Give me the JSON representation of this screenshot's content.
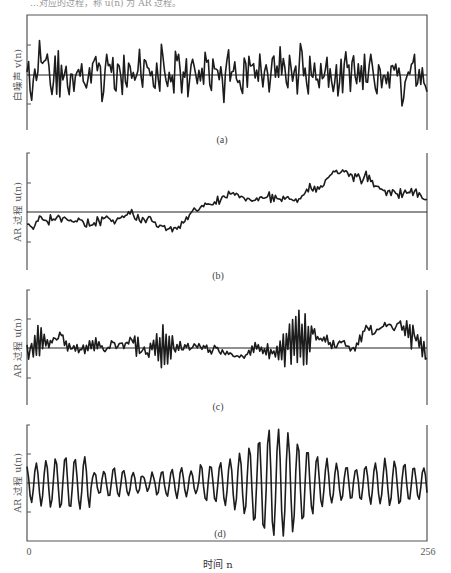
{
  "header_fragment": "…对应的过程，称 u(n) 为 AR 过程。",
  "chart_data": [
    {
      "id": "a",
      "type": "line",
      "caption": "(a)",
      "ylabel": "白噪声 v(n)",
      "xlabel": "时间 n",
      "x_range": [
        0,
        256
      ],
      "description": "White noise input: zero-mean, uncorrelated samples with roughly uniform amplitude across n",
      "amplitude": 1.0,
      "seed": 11,
      "model": {
        "kind": "white",
        "gain": 1.0
      },
      "grid": false
    },
    {
      "id": "b",
      "type": "line",
      "caption": "(b)",
      "ylabel": "AR 过程 u(n)",
      "xlabel": "时间 n",
      "x_range": [
        0,
        256
      ],
      "description": "AR process with pole near +1: low-frequency wandering; negative for n<~100, positive ~100-230, large bump near n≈190",
      "seed": 11,
      "model": {
        "kind": "ar1",
        "a": 0.93,
        "gain": 0.3,
        "hf": 0.35
      },
      "grid": false
    },
    {
      "id": "c",
      "type": "line",
      "caption": "(c)",
      "ylabel": "AR 过程 u(n)",
      "xlabel": "时间 n",
      "x_range": [
        0,
        256
      ],
      "description": "AR process with poles near +1 and -1: slow drift plus bursts of alternating high-frequency oscillation",
      "seed": 11,
      "model": {
        "kind": "mixed",
        "a_low": 0.9,
        "a_high": -0.88,
        "gain": 0.28
      },
      "grid": false
    },
    {
      "id": "d",
      "type": "line",
      "caption": "(d)",
      "ylabel": "AR 过程 u(n)",
      "xlabel": "时间 n",
      "x_range": [
        0,
        256
      ],
      "description": "AR(2) narrowband process: quasi-periodic oscillation (period ≈ 6 samples) with amplitude envelope peaking near n≈160",
      "seed": 11,
      "model": {
        "kind": "ar2",
        "r": 0.93,
        "period": 6.2,
        "gain": 0.22
      },
      "grid": false
    }
  ],
  "axis": {
    "x_tick_start": "0",
    "x_tick_end": "256",
    "x_label": "时间 n"
  },
  "colors": {
    "line": "#1c1c1c",
    "frame": "#555555",
    "background": "#ffffff"
  }
}
